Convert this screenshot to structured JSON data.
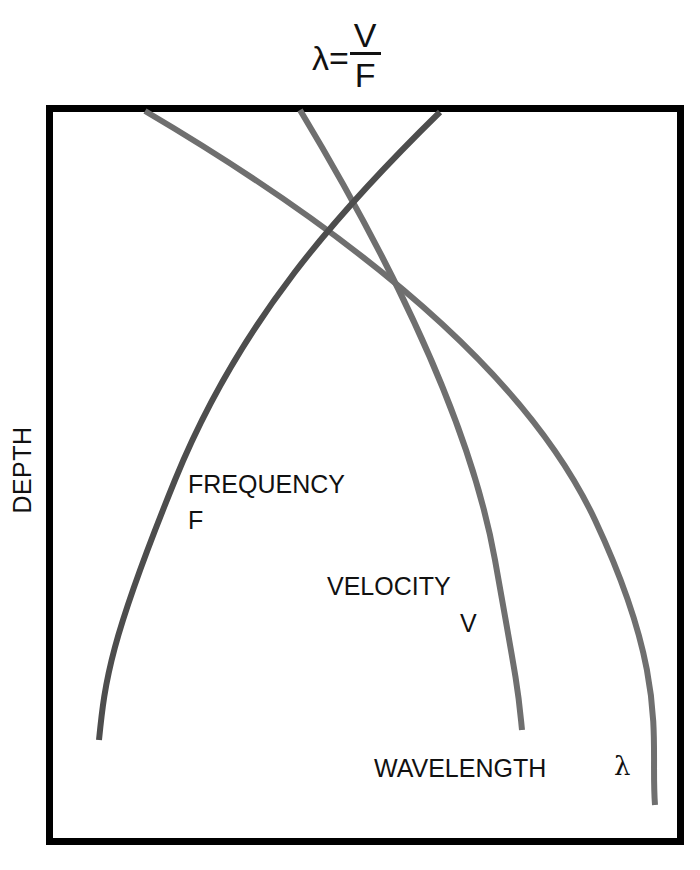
{
  "formula": {
    "lhs": "λ=",
    "numerator": "V",
    "denominator": "F"
  },
  "axis": {
    "ylabel": "DEPTH"
  },
  "labels": {
    "frequency": "FREQUENCY",
    "frequency_symbol": "F",
    "velocity": "VELOCITY",
    "velocity_symbol": "V",
    "wavelength": "WAVELENGTH",
    "wavelength_symbol": "λ"
  },
  "colors": {
    "frame": "#000000",
    "frequency_curve": "#4d4d4d",
    "velocity_curve": "#6f6f6f",
    "wavelength_curve": "#6f6f6f"
  },
  "curves": [
    {
      "name": "Frequency F",
      "trend": "decreasing with depth",
      "start": [
        440,
        112
      ],
      "end": [
        99,
        740
      ]
    },
    {
      "name": "Velocity V",
      "trend": "increasing with depth",
      "start": [
        300,
        110
      ],
      "end": [
        522,
        730
      ]
    },
    {
      "name": "Wavelength λ",
      "trend": "increasing with depth",
      "start": [
        145,
        111
      ],
      "end": [
        655,
        805
      ]
    }
  ]
}
